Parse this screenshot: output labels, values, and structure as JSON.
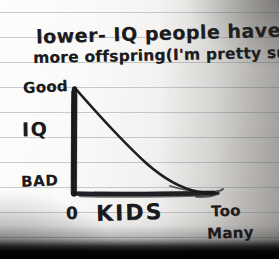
{
  "medium": {
    "surface": "ruled-notebook-paper",
    "ink_color": "#1b1b1d",
    "paper_color": "#f7f6f4",
    "rule_color": "#78848c"
  },
  "caption": {
    "line1": "lower- IQ people have",
    "line2": "more offspring(I'm pretty sure.)"
  },
  "chart_data": {
    "type": "line",
    "title": "lower- IQ people have more offspring(I'm pretty sure.)",
    "xlabel": "KIDS",
    "ylabel": "IQ",
    "x_tick_labels": [
      "0",
      "Too Many"
    ],
    "y_tick_labels": [
      "BAD",
      "Good"
    ],
    "ylim": [
      0,
      1
    ],
    "xlim": [
      0,
      1
    ],
    "grid": false,
    "legend": null,
    "series": [
      {
        "name": "IQ vs number of kids",
        "x": [
          0.0,
          0.12,
          0.26,
          0.4,
          0.52,
          0.62,
          0.72,
          0.84,
          1.0
        ],
        "y": [
          1.0,
          0.84,
          0.64,
          0.45,
          0.28,
          0.15,
          0.07,
          0.03,
          0.02
        ]
      }
    ],
    "annotations": [
      {
        "text": "Good",
        "position": "y-axis-top"
      },
      {
        "text": "BAD",
        "position": "y-axis-bottom"
      },
      {
        "text": "0",
        "position": "x-axis-origin"
      },
      {
        "text": "Too Many",
        "position": "x-axis-right"
      }
    ]
  },
  "axes": {
    "y_top_label": "Good",
    "y_name": "IQ",
    "y_bottom_label": "BAD",
    "x_origin_label": "0",
    "x_name": "KIDS",
    "x_max_label_line1": "Too",
    "x_max_label_line2": "Many"
  },
  "rules": {
    "y_positions": [
      12,
      37,
      62,
      87,
      112,
      137,
      162,
      187,
      212,
      237
    ]
  }
}
